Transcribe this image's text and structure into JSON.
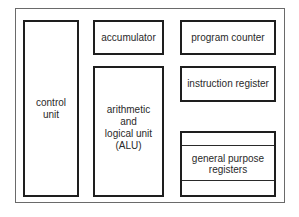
{
  "diagram": {
    "title": "",
    "components": {
      "control_unit": "control\nunit",
      "accumulator": "accumulator",
      "alu": "arithmetic\nand\nlogical unit\n(ALU)",
      "program_counter": "program counter",
      "instruction_register": "instruction register",
      "general_purpose_registers": "general purpose\nregisters"
    },
    "colors": {
      "stroke": "#1e1e1e",
      "frame": "#6a6a6a",
      "background": "#ffffff"
    }
  }
}
